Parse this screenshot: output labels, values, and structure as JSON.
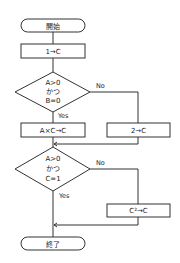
{
  "flowchart": {
    "start": "開始",
    "init": "1→C",
    "decision1": {
      "lines": [
        "A>0",
        "かつ",
        "B=0"
      ],
      "yes": "Yes",
      "no": "No"
    },
    "yes_process1": "A×C→C",
    "no_process1": "2→C",
    "decision2": {
      "lines": [
        "A>0",
        "かつ",
        "C=1"
      ],
      "yes": "Yes",
      "no": "No"
    },
    "no_process2": "C²→C",
    "end": "終了"
  },
  "colors": {
    "stroke": "#333333",
    "background": "#ffffff"
  }
}
